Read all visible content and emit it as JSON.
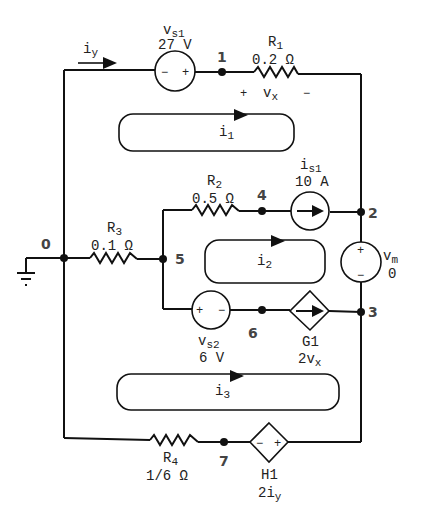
{
  "nodes": [
    {
      "id": "0",
      "label": "0"
    },
    {
      "id": "1",
      "label": "1"
    },
    {
      "id": "2",
      "label": "2"
    },
    {
      "id": "3",
      "label": "3"
    },
    {
      "id": "4",
      "label": "4"
    },
    {
      "id": "5",
      "label": "5"
    },
    {
      "id": "6",
      "label": "6"
    },
    {
      "id": "7",
      "label": "7"
    }
  ],
  "components": {
    "vs1": {
      "name_main": "v",
      "name_sub": "s1",
      "value": "27 V",
      "minus": "−",
      "plus": "+"
    },
    "r1": {
      "name_main": "R",
      "name_sub": "1",
      "value": "0.2 Ω"
    },
    "vx": {
      "plus": "+",
      "name_main": "v",
      "name_sub": "x",
      "minus": "−"
    },
    "r2": {
      "name_main": "R",
      "name_sub": "2",
      "value": "0.5 Ω"
    },
    "is1": {
      "name_main": "i",
      "name_sub": "s1",
      "value": "10 A"
    },
    "vm": {
      "name_main": "v",
      "name_sub": "m",
      "value": "0",
      "plus": "+",
      "minus": "−"
    },
    "r3": {
      "name_main": "R",
      "name_sub": "3",
      "value": "0.1 Ω"
    },
    "vs2": {
      "name_main": "v",
      "name_sub": "s2",
      "value": "6 V",
      "plus": "+",
      "minus": "−"
    },
    "g1": {
      "name": "G1",
      "gain_main": "2v",
      "gain_sub": "x"
    },
    "r4": {
      "name_main": "R",
      "name_sub": "4",
      "value": "1/6 Ω"
    },
    "h1": {
      "name": "H1",
      "gain_main": "2i",
      "gain_sub": "y",
      "minus": "−",
      "plus": "+"
    }
  },
  "currents": {
    "iy": {
      "main": "i",
      "sub": "y"
    },
    "i1": {
      "main": "i",
      "sub": "1"
    },
    "i2": {
      "main": "i",
      "sub": "2"
    },
    "i3": {
      "main": "i",
      "sub": "3"
    }
  }
}
